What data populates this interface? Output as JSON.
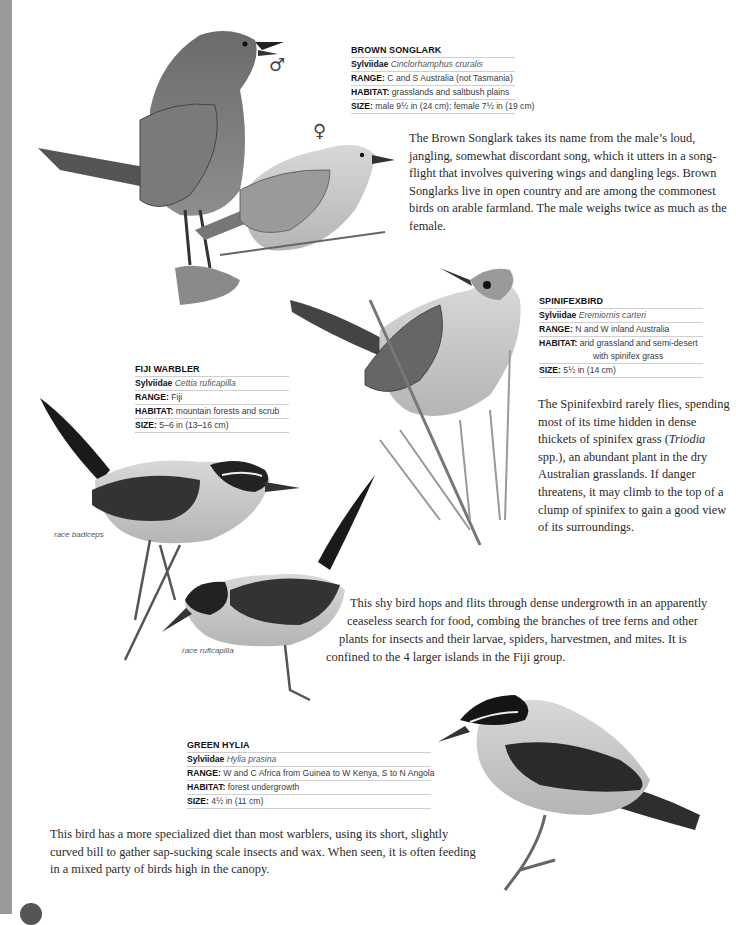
{
  "page": {
    "edge_color": "#9a9a9a"
  },
  "species": {
    "brown_songlark": {
      "name": "BROWN SONGLARK",
      "family": "Sylviidae",
      "scientific": "Cinclorhamphus cruralis",
      "range_label": "RANGE:",
      "range": "C and S Australia (not Tasmania)",
      "habitat_label": "HABITAT:",
      "habitat": "grasslands and saltbush plains",
      "size_label": "SIZE:",
      "size": "male 9½ in (24 cm); female 7½ in (19 cm)",
      "male_symbol": "♂",
      "female_symbol": "♀",
      "description": "The Brown Songlark takes its name from the male’s loud, jangling, somewhat discordant song, which it utters in a song-flight that involves quivering wings and dangling legs. Brown Songlarks live in open country and are among the commonest birds on arable farmland.  The male weighs twice as much as the female."
    },
    "spinifexbird": {
      "name": "SPINIFEXBIRD",
      "family": "Sylviidae",
      "scientific": "Eremiornis carteri",
      "range_label": "RANGE:",
      "range": "N and W inland Australia",
      "habitat_label": "HABITAT:",
      "habitat": "arid grassland and semi-desert",
      "habitat_cont": "with spinifex grass",
      "size_label": "SIZE:",
      "size": "5½ in (14 cm)",
      "description_1": "The Spinifexbird rarely flies, spending most of its time hidden in dense thickets of spinifex grass (",
      "description_italic": "Triodia",
      "description_2": " spp.), an abundant plant in the dry Australian grasslands. If danger threatens, it may climb to the top of a clump of spinifex to gain a good view of its surroundings."
    },
    "fiji_warbler": {
      "name": "FIJI WARBLER",
      "family": "Sylviidae",
      "scientific": "Cettia ruficapilla",
      "range_label": "RANGE:",
      "range": "Fiji",
      "habitat_label": "HABITAT:",
      "habitat": "mountain forests and scrub",
      "size_label": "SIZE:",
      "size": "5–6 in (13–16 cm)",
      "caption_1": "race badiceps",
      "caption_2": "race ruficapilla",
      "description_lines": [
        "This shy bird hops and flits through dense undergrowth in an apparently",
        "ceaseless search for food, combing the branches of tree ferns and other",
        "plants for insects and their larvae, spiders, harvestmen, and mites. It is",
        "confined to the 4 larger islands in the Fiji group."
      ]
    },
    "green_hylia": {
      "name": "GREEN HYLIA",
      "family": "Sylviidae",
      "scientific": "Hylia prasina",
      "range_label": "RANGE:",
      "range": "W and C Africa from Guinea to W Kenya, S to N Angola",
      "habitat_label": "HABITAT:",
      "habitat": "forest undergrowth",
      "size_label": "SIZE:",
      "size": "4½ in (11 cm)",
      "description": "This bird has a more specialized diet than most warblers, using its short, slightly curved bill to gather sap-sucking scale insects and wax. When seen, it is often feeding in a mixed party of birds high in the canopy."
    }
  }
}
